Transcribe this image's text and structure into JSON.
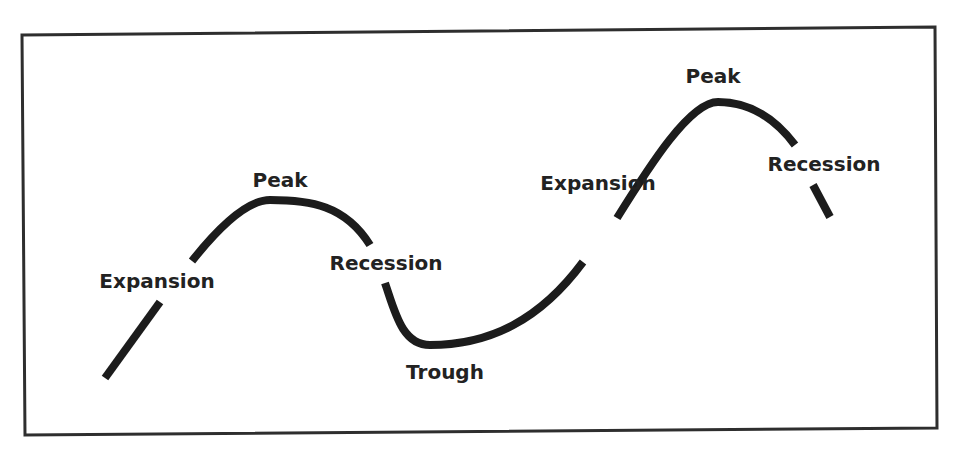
{
  "diagram": {
    "type": "business-cycle",
    "colors": {
      "background": "#ffffff",
      "frame": "#2e2e2e",
      "curve": "#1c1c1c",
      "text": "#222222"
    },
    "frame": {
      "corners": {
        "top_left": [
          22,
          35
        ],
        "top_right": [
          935,
          27
        ],
        "bottom_right": [
          937,
          428
        ],
        "bottom_left": [
          25,
          435
        ]
      }
    },
    "labels": [
      {
        "id": "expansion-1",
        "text": "Expansion",
        "x": 157,
        "y": 288
      },
      {
        "id": "peak-1",
        "text": "Peak",
        "x": 280,
        "y": 187
      },
      {
        "id": "recession-1",
        "text": "Recession",
        "x": 386,
        "y": 270
      },
      {
        "id": "trough",
        "text": "Trough",
        "x": 445,
        "y": 379
      },
      {
        "id": "expansion-2",
        "text": "Expansion",
        "x": 598,
        "y": 190
      },
      {
        "id": "peak-2",
        "text": "Peak",
        "x": 713,
        "y": 83
      },
      {
        "id": "recession-2",
        "text": "Recession",
        "x": 824,
        "y": 171
      }
    ],
    "curve_segments": [
      "M 105 378 L 160 302",
      "M 192 261 C 215 232, 245 200, 270 200 C 310 200, 345 205, 370 245",
      "M 385 283 C 395 312, 402 345, 430 345 C 490 345, 540 320, 583 262",
      "M 617 218 C 650 165, 690 102, 718 102 C 755 102, 780 125, 795 145",
      "M 813 185 L 830 217"
    ]
  }
}
